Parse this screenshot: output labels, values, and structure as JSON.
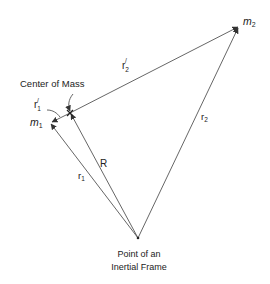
{
  "diagram": {
    "labels": {
      "center_of_mass": "Center of Mass",
      "origin_line1": "Point of an",
      "origin_line2": "Inertial Frame",
      "m1": "m",
      "m1_sub": "1",
      "m2": "m",
      "m2_sub": "2",
      "R": "R",
      "r1": "r",
      "r1_sub": "1",
      "r2": "r",
      "r2_sub": "2",
      "r1_prime": "r",
      "r1_prime_sub": "1",
      "r1_prime_sup": "/",
      "r2_prime": "r",
      "r2_prime_sub": "2",
      "r2_prime_sup": "/"
    },
    "vectors": [
      {
        "name": "r1",
        "from": "origin",
        "to": "m1"
      },
      {
        "name": "r2",
        "from": "origin",
        "to": "m2"
      },
      {
        "name": "R",
        "from": "origin",
        "to": "center_of_mass"
      },
      {
        "name": "r1_prime",
        "from": "center_of_mass",
        "to": "m1"
      },
      {
        "name": "r2_prime",
        "from": "center_of_mass",
        "to": "m2"
      }
    ]
  }
}
